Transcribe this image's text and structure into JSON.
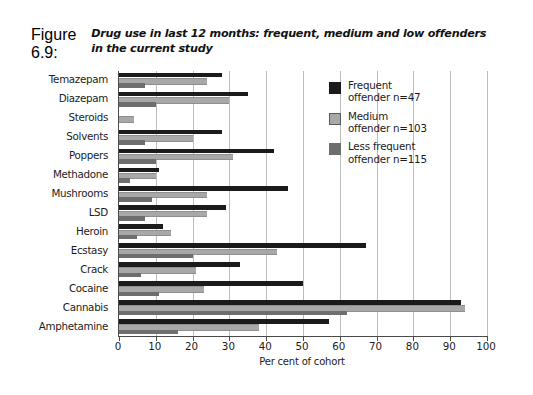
{
  "figure": {
    "number": "Figure 6.9:",
    "title": "Drug use in last 12 months: frequent, medium and low offenders in the current study"
  },
  "legend": {
    "position": "top-right",
    "items": [
      {
        "label_line1": "Frequent",
        "label_line2": "offender n=47",
        "color": "#1b1b1b",
        "swatch": "swatch-frequent"
      },
      {
        "label_line1": "Medium",
        "label_line2": "offender n=103",
        "color": "#a8a8a8",
        "swatch": "swatch-medium"
      },
      {
        "label_line1": "Less frequent",
        "label_line2": "offender n=115",
        "color": "#6e6e6e",
        "swatch": "swatch-less"
      }
    ]
  },
  "chart_data": {
    "type": "bar",
    "orientation": "horizontal",
    "title": "Drug use in last 12 months: frequent, medium and low offenders in the current study",
    "xlabel": "Per cent of cohort",
    "ylabel": "",
    "xlim": [
      0,
      100
    ],
    "xticks": [
      0,
      10,
      20,
      30,
      40,
      50,
      60,
      70,
      80,
      90,
      100
    ],
    "grid": true,
    "grid_axis": "x",
    "legend_position": "top-right",
    "categories": [
      "Temazepam",
      "Diazepam",
      "Steroids",
      "Solvents",
      "Poppers",
      "Methadone",
      "Mushrooms",
      "LSD",
      "Heroin",
      "Ecstasy",
      "Crack",
      "Cocaine",
      "Cannabis",
      "Amphetamine"
    ],
    "series": [
      {
        "name": "Frequent offender n=47",
        "color": "#1b1b1b",
        "values": [
          28,
          35,
          0,
          28,
          42,
          11,
          46,
          29,
          12,
          67,
          33,
          50,
          93,
          57
        ]
      },
      {
        "name": "Medium offender n=103",
        "color": "#a8a8a8",
        "values": [
          24,
          30,
          4,
          20,
          31,
          10,
          24,
          24,
          14,
          43,
          21,
          23,
          94,
          38
        ]
      },
      {
        "name": "Less frequent offender n=115",
        "color": "#6e6e6e",
        "values": [
          7,
          10,
          0,
          7,
          10,
          3,
          9,
          7,
          5,
          20,
          6,
          11,
          62,
          16
        ]
      }
    ]
  }
}
